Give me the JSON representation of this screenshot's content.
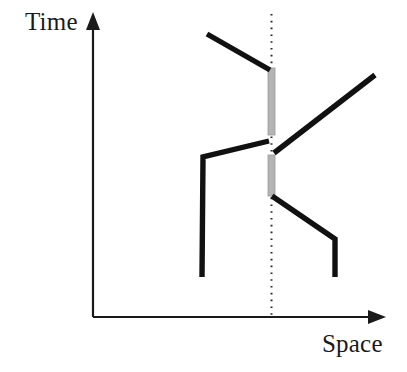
{
  "diagram": {
    "kind": "spacetime-worldline-diagram",
    "background_color": "#ffffff",
    "axes": {
      "y_axis": {
        "label": "Time",
        "color": "#1a1a1a",
        "stroke_width": 2.2,
        "x": 93,
        "y_top": 16,
        "y_bottom": 317,
        "arrow": "up",
        "arrow_tip_y": 12,
        "arrow_half_width": 7,
        "arrow_length": 18
      },
      "x_axis": {
        "label": "Space",
        "color": "#1a1a1a",
        "stroke_width": 2.2,
        "y": 317,
        "x_left": 93,
        "x_right": 377,
        "arrow": "right",
        "arrow_tip_x": 386,
        "arrow_half_width": 7,
        "arrow_length": 18
      }
    },
    "reference_line": {
      "name": "vertical-dotted-reference-line",
      "color": "#2b2b2b",
      "x": 271.5,
      "y_top": 14,
      "y_bottom": 317,
      "stroke_width": 2.0,
      "dash": "1.6 5.2",
      "style": "dotted"
    },
    "gray_segments": [
      {
        "name": "upper-gray-segment",
        "color": "#b4b4b4",
        "edge_color": "#9a9a9a",
        "x": 271.5,
        "y_start": 68,
        "y_end": 135,
        "width": 7
      },
      {
        "name": "lower-gray-segment",
        "color": "#b4b4b4",
        "edge_color": "#9a9a9a",
        "x": 271.5,
        "y_start": 155,
        "y_end": 196,
        "width": 7
      }
    ],
    "worldlines": [
      {
        "name": "incoming-upper-left-worldline",
        "color": "#111111",
        "stroke_width": 5.4,
        "points": [
          [
            207,
            34
          ],
          [
            270,
            70
          ]
        ]
      },
      {
        "name": "left-vertical-worldline",
        "color": "#111111",
        "stroke_width": 5.4,
        "points": [
          [
            202,
            277
          ],
          [
            203,
            157
          ],
          [
            269,
            141
          ]
        ]
      },
      {
        "name": "outgoing-upper-right-worldline",
        "color": "#111111",
        "stroke_width": 5.4,
        "points": [
          [
            274,
            153
          ],
          [
            375,
            75
          ]
        ]
      },
      {
        "name": "outgoing-lower-right-worldline",
        "color": "#111111",
        "stroke_width": 5.4,
        "points": [
          [
            272,
            196
          ],
          [
            335,
            239
          ],
          [
            335,
            277
          ]
        ]
      }
    ]
  }
}
